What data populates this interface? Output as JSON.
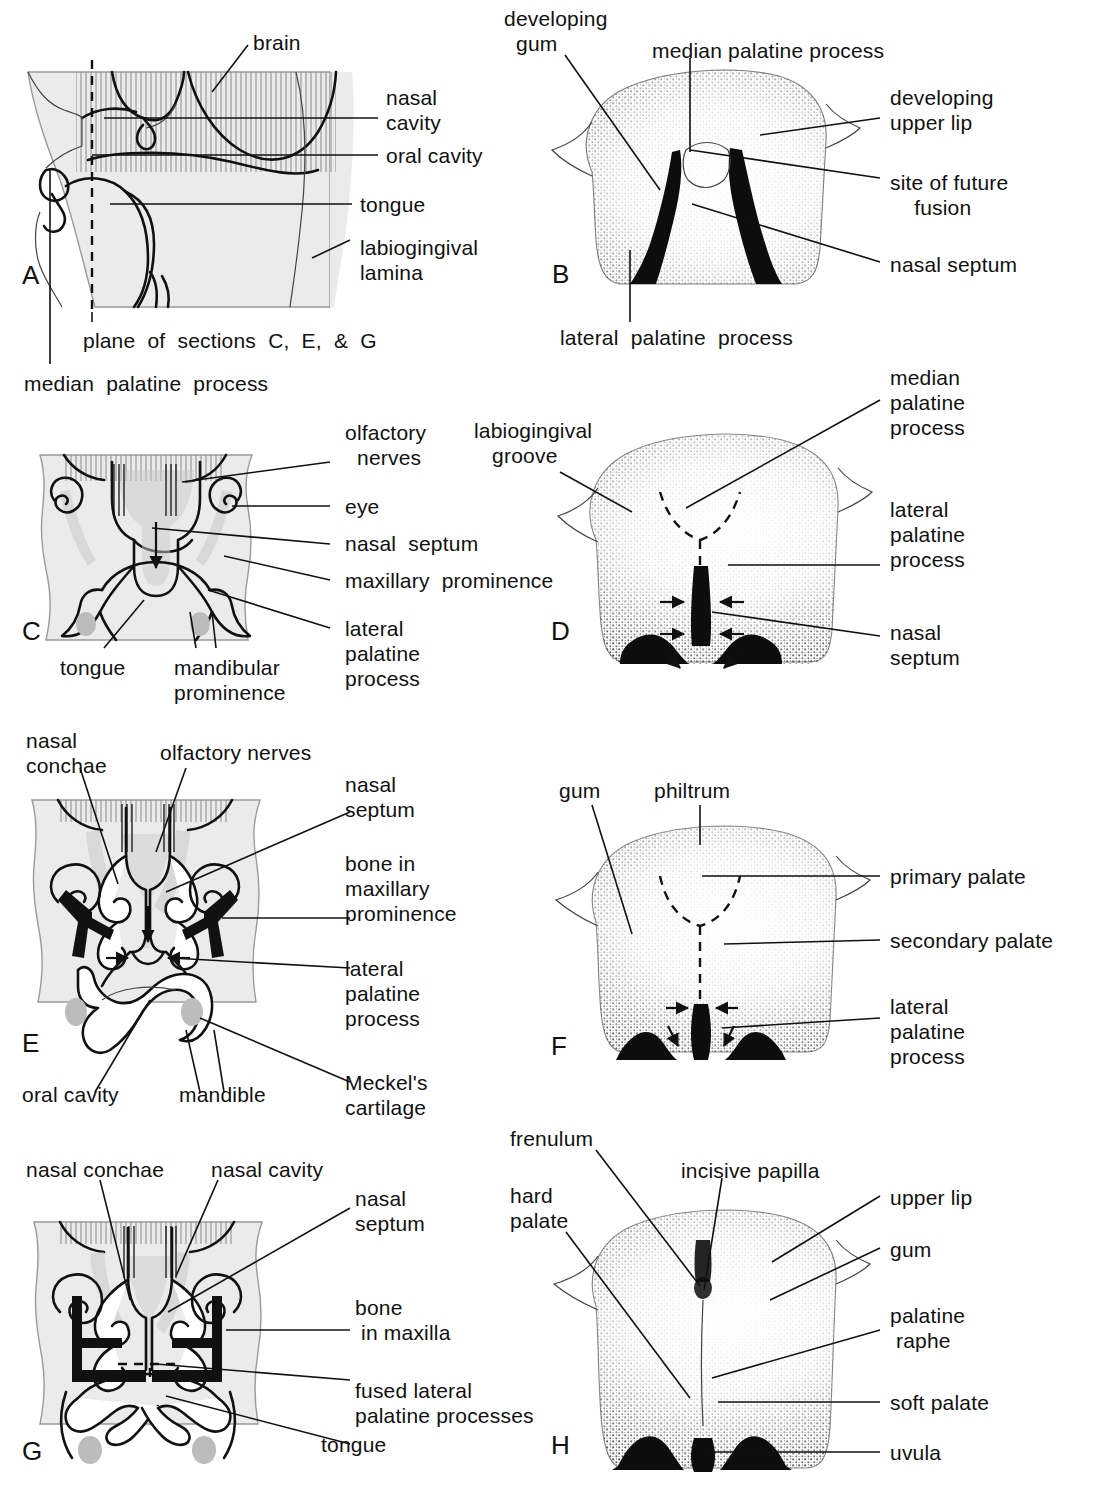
{
  "figure": {
    "panels": [
      "A",
      "B",
      "C",
      "D",
      "E",
      "F",
      "G",
      "H"
    ]
  },
  "panel_letters": {
    "a": "A",
    "b": "B",
    "c": "C",
    "d": "D",
    "e": "E",
    "f": "F",
    "g": "G",
    "h": "H"
  },
  "panel_a": {
    "letter": "A",
    "labels": {
      "brain": "brain",
      "nasal_cavity": "nasal\ncavity",
      "oral_cavity": "oral cavity",
      "tongue": "tongue",
      "labiogingival_lamina": "labiogingival\nlamina",
      "plane_of_sections": "plane  of  sections  C,  E,  &  G",
      "median_palatine_process": "median  palatine  process"
    }
  },
  "panel_b": {
    "letter": "B",
    "labels": {
      "developing_gum": "developing\n  gum",
      "median_palatine_process": "median palatine process",
      "developing_upper_lip": "developing\nupper lip",
      "site_of_future_fusion": "site of future\n    fusion",
      "nasal_septum": "nasal septum",
      "lateral_palatine_process": "lateral  palatine  process"
    }
  },
  "panel_c": {
    "letter": "C",
    "labels": {
      "olfactory_nerves": "olfactory\n  nerves",
      "eye": "eye",
      "nasal_septum": "nasal  septum",
      "maxillary_prominence": "maxillary  prominence",
      "lateral_palatine_process": "lateral\npalatine\nprocess",
      "tongue": "tongue",
      "mandibular_prominence": "mandibular\nprominence"
    }
  },
  "panel_d": {
    "letter": "D",
    "labels": {
      "labiogingival_groove": "labiogingival\n   groove",
      "median_palatine_process": "median\npalatine\nprocess",
      "lateral_palatine_process": "lateral\npalatine\nprocess",
      "nasal_septum": "nasal\nseptum"
    }
  },
  "panel_e": {
    "letter": "E",
    "labels": {
      "nasal_conchae": "nasal\nconchae",
      "olfactory_nerves": "olfactory nerves",
      "nasal_septum": "nasal\nseptum",
      "bone_in_maxillary_prominence": "bone in\nmaxillary\nprominence",
      "lateral_palatine_process": "lateral\npalatine\nprocess",
      "oral_cavity": "oral cavity",
      "mandible": "mandible",
      "meckels_cartilage": "Meckel's\ncartilage"
    }
  },
  "panel_f": {
    "letter": "F",
    "labels": {
      "gum": "gum",
      "philtrum": "philtrum",
      "primary_palate": "primary palate",
      "secondary_palate": "secondary palate",
      "lateral_palatine_process": "lateral\npalatine\nprocess"
    }
  },
  "panel_g": {
    "letter": "G",
    "labels": {
      "nasal_conchae": "nasal conchae",
      "nasal_cavity": "nasal cavity",
      "nasal_septum": "nasal\nseptum",
      "bone_in_maxilla": "bone\n in maxilla",
      "fused_lateral_palatine_processes": "fused lateral\npalatine processes",
      "tongue": "tongue"
    }
  },
  "panel_h": {
    "letter": "H",
    "labels": {
      "frenulum": "frenulum",
      "incisive_papilla": "incisive papilla",
      "hard_palate": "hard\npalate",
      "upper_lip": "upper lip",
      "gum": "gum",
      "palatine_raphe": "palatine\n raphe",
      "soft_palate": "soft palate",
      "uvula": "uvula"
    }
  },
  "colors": {
    "ink": "#111111",
    "tissue": "#ebebeb",
    "tissue_edge": "#9a9a9a",
    "gray_accent": "#c9c9c9",
    "paper": "#ffffff"
  }
}
